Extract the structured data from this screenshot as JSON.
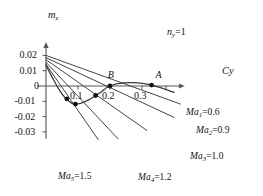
{
  "chart_data": {
    "type": "line",
    "title": "",
    "xlabel": "Cy",
    "ylabel": "mz",
    "xlabel_display": "Cy",
    "ylabel_base": "m",
    "ylabel_sub": "z",
    "annotation": {
      "base": "n",
      "sub": "y",
      "text": "=1",
      "full": "ny=1"
    },
    "xlim": [
      -0.02,
      0.42
    ],
    "ylim": [
      -0.035,
      0.024
    ],
    "xticks": [
      0.1,
      0.2,
      0.3
    ],
    "xtick_labels": [
      "0.1",
      "0.2",
      "0.3"
    ],
    "yticks": [
      0.02,
      0.01,
      0,
      -0.01,
      -0.02,
      -0.03
    ],
    "ytick_labels": [
      "0.02",
      "0.01",
      "0",
      "-0.01",
      "-0.02",
      "-0.03"
    ],
    "grid": false,
    "legend_position": "inline-right",
    "series": [
      {
        "name": "Ma1=0.6",
        "label_base": "Ma",
        "label_sub": "1",
        "label_value": "=0.6",
        "type": "line",
        "x": [
          0.0,
          0.42
        ],
        "y": [
          0.02,
          -0.0118
        ]
      },
      {
        "name": "Ma2=0.9",
        "label_base": "Ma",
        "label_sub": "2",
        "label_value": "=0.9",
        "type": "line",
        "x": [
          0.0,
          0.4
        ],
        "y": [
          0.0185,
          -0.0205
        ]
      },
      {
        "name": "Ma3=1.0",
        "label_base": "Ma",
        "label_sub": "3",
        "label_value": "=1.0",
        "type": "line",
        "x": [
          0.0,
          0.315
        ],
        "y": [
          0.0172,
          -0.029
        ]
      },
      {
        "name": "Ma4=1.2",
        "label_base": "Ma",
        "label_sub": "4",
        "label_value": "=1.2",
        "type": "line",
        "x": [
          0.0,
          0.225
        ],
        "y": [
          0.0155,
          -0.0345
        ]
      },
      {
        "name": "Ma5=1.5",
        "label_base": "Ma",
        "label_sub": "5",
        "label_value": "=1.5",
        "type": "line",
        "x": [
          0.0,
          0.163
        ],
        "y": [
          0.0142,
          -0.035
        ]
      },
      {
        "name": "mz-curve",
        "label_base": "",
        "label_sub": "",
        "label_value": "",
        "type": "curve",
        "x": [
          0.0,
          0.02,
          0.04,
          0.06,
          0.08,
          0.092,
          0.11,
          0.13,
          0.15,
          0.17,
          0.19,
          0.2,
          0.22,
          0.245,
          0.27,
          0.3,
          0.33,
          0.36,
          0.4
        ],
        "y": [
          0.0135,
          0.0055,
          -0.002,
          -0.0078,
          -0.0112,
          -0.0118,
          -0.0112,
          -0.0094,
          -0.007,
          -0.0042,
          -0.001,
          0.0,
          0.0014,
          0.0021,
          0.0022,
          0.0017,
          0.0006,
          -0.0012,
          -0.0042
        ]
      }
    ],
    "markers": [
      {
        "label": "",
        "x": 0.065,
        "y": -0.0084
      },
      {
        "label": "",
        "x": 0.092,
        "y": -0.0118
      },
      {
        "label": "",
        "x": 0.155,
        "y": -0.0062
      },
      {
        "label": "B",
        "x": 0.2,
        "y": 0.0
      },
      {
        "label": "A",
        "x": 0.33,
        "y": 0.0006
      }
    ],
    "point_labels": [
      {
        "text": "B",
        "x": 0.193,
        "y": 0.0042
      },
      {
        "text": "A",
        "x": 0.342,
        "y": 0.004
      }
    ]
  }
}
